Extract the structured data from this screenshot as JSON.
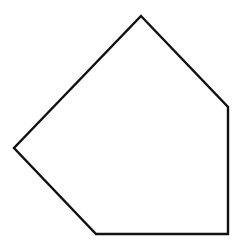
{
  "diagram": {
    "shape": "pentagon",
    "stroke_color": "#111111",
    "fill_color": "#ffffff",
    "stroke_width": 2.4,
    "vertices": [
      [
        141,
        16
      ],
      [
        228,
        107
      ],
      [
        228,
        234
      ],
      [
        96,
        234
      ],
      [
        14,
        148
      ]
    ]
  }
}
